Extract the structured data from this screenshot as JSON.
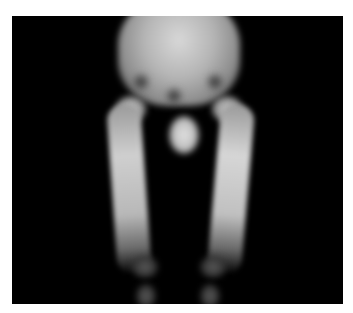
{
  "image": {
    "description": "Grayscale bone scintigraphy of pelvis and lower limbs (anterior view)",
    "frame_color": "#000000",
    "background_color": "#ffffff"
  }
}
